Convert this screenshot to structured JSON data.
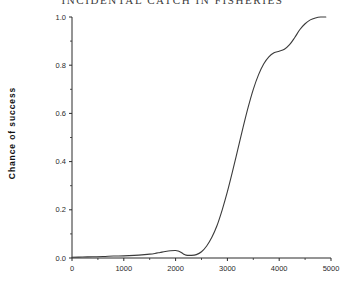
{
  "chart_data": {
    "type": "line",
    "title": "INCIDENTAL CATCH IN FISHERIES",
    "xlabel": "",
    "ylabel": "Chance of  success",
    "xlim": [
      0,
      5000
    ],
    "ylim": [
      0.0,
      1.0
    ],
    "grid": false,
    "legend": null,
    "line_color": "#3b3b3b",
    "xticks": [
      0,
      1000,
      2000,
      3000,
      4000,
      5000
    ],
    "xtick_labels": [
      "0",
      "1000",
      "2000",
      "3000",
      "4000",
      "5000"
    ],
    "x_minor_ticks": [
      500,
      1500,
      2500,
      3500,
      4500
    ],
    "yticks": [
      0.0,
      0.2,
      0.4,
      0.6,
      0.8,
      1.0
    ],
    "ytick_labels": [
      "0.0",
      "0.2",
      "0.4",
      "0.6",
      "0.8",
      "1.0"
    ],
    "y_minor_ticks": [
      0.1,
      0.3,
      0.5,
      0.7,
      0.9
    ],
    "series": [
      {
        "name": "Chance of success",
        "x": [
          0,
          200,
          400,
          600,
          800,
          1000,
          1200,
          1400,
          1500,
          1600,
          1700,
          1800,
          1900,
          2000,
          2050,
          2100,
          2150,
          2200,
          2300,
          2400,
          2500,
          2600,
          2700,
          2800,
          2900,
          3000,
          3100,
          3200,
          3300,
          3400,
          3500,
          3600,
          3700,
          3800,
          3900,
          4000,
          4100,
          4200,
          4300,
          4400,
          4500,
          4600,
          4700,
          4800,
          4900
        ],
        "y": [
          0.003,
          0.004,
          0.005,
          0.006,
          0.008,
          0.009,
          0.011,
          0.014,
          0.016,
          0.019,
          0.023,
          0.027,
          0.03,
          0.031,
          0.029,
          0.024,
          0.017,
          0.012,
          0.011,
          0.014,
          0.026,
          0.05,
          0.086,
          0.135,
          0.2,
          0.275,
          0.36,
          0.45,
          0.54,
          0.625,
          0.7,
          0.76,
          0.805,
          0.835,
          0.852,
          0.858,
          0.866,
          0.885,
          0.915,
          0.948,
          0.972,
          0.988,
          0.996,
          1.0,
          1.0
        ]
      }
    ]
  },
  "axes": {
    "title_text": "INCIDENTAL CATCH IN FISHERIES",
    "y_axis_title": "Chance of  success",
    "x_axis_title": ""
  }
}
